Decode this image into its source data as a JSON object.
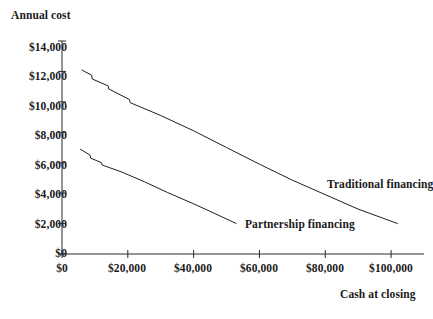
{
  "chart_data": {
    "type": "line",
    "title": "Annual cost",
    "subtitle": "",
    "xlabel": "Cash at closing",
    "ylabel": "Annual cost",
    "xlim": [
      0,
      110000
    ],
    "ylim": [
      0,
      14000
    ],
    "grid": false,
    "legend_position": "inline-annotation",
    "x_tick_labels": [
      "$0",
      "$20,000",
      "$40,000",
      "$60,000",
      "$80,000",
      "$100,000"
    ],
    "x_tick_values": [
      0,
      20000,
      40000,
      60000,
      80000,
      100000
    ],
    "y_tick_labels": [
      "$0",
      "$2,000",
      "$4,000",
      "$6,000",
      "$8,000",
      "$10,000",
      "$12,000",
      "$14,000"
    ],
    "y_tick_values": [
      0,
      2000,
      4000,
      6000,
      8000,
      10000,
      12000,
      14000
    ],
    "series": [
      {
        "name": "Traditional financing",
        "annotation": "Traditional financing",
        "points": [
          [
            6000,
            12100
          ],
          [
            9000,
            11750
          ],
          [
            9200,
            11500
          ],
          [
            14000,
            11050
          ],
          [
            14200,
            10850
          ],
          [
            20500,
            10150
          ],
          [
            20700,
            9950
          ],
          [
            30000,
            9100
          ],
          [
            40000,
            8100
          ],
          [
            50000,
            7000
          ],
          [
            60000,
            5900
          ],
          [
            70000,
            4850
          ],
          [
            80000,
            3900
          ],
          [
            90000,
            2950
          ],
          [
            102000,
            2000
          ]
        ]
      },
      {
        "name": "Partnership financing",
        "annotation": "Partnership financing",
        "points": [
          [
            5500,
            6900
          ],
          [
            8500,
            6500
          ],
          [
            8700,
            6300
          ],
          [
            12000,
            6000
          ],
          [
            12200,
            5850
          ],
          [
            18000,
            5400
          ],
          [
            25000,
            4750
          ],
          [
            32000,
            4050
          ],
          [
            40000,
            3300
          ],
          [
            46000,
            2700
          ],
          [
            53000,
            2000
          ]
        ]
      }
    ]
  }
}
